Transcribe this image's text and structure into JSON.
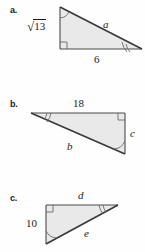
{
  "figure": {
    "background_color": "#fefefe",
    "fill_color": "#e9e9e9",
    "stroke_color": "#4a4a4a",
    "parts": [
      {
        "key": "a",
        "part_label": "a.",
        "labels": {
          "hypotenuse": "a",
          "vertical_leg": "13",
          "vertical_leg_radical": "√",
          "horizontal_leg": "6"
        },
        "angle_marks": [
          "single-arc-top",
          "double-arc-right",
          "right-angle-bottom-left"
        ]
      },
      {
        "key": "b",
        "part_label": "b.",
        "labels": {
          "top_leg": "18",
          "hypotenuse": "b",
          "vertical_leg": "c"
        },
        "angle_marks": [
          "double-arc-left",
          "right-angle-top-right",
          "single-arc-bottom-right"
        ]
      },
      {
        "key": "c",
        "part_label": "c.",
        "labels": {
          "top_leg": "d",
          "vertical_leg": "10",
          "hypotenuse": "e"
        },
        "angle_marks": [
          "right-angle-top-left",
          "double-arc-top-right",
          "single-arc-bottom-left"
        ]
      }
    ]
  }
}
